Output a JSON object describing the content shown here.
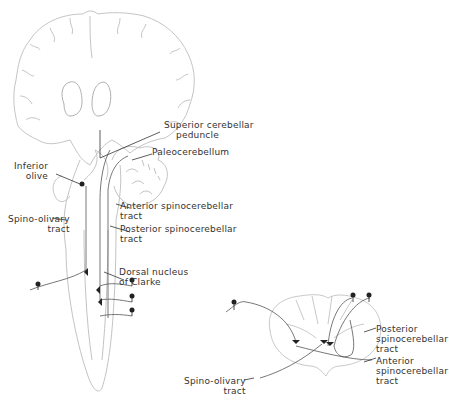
{
  "figure": {
    "left_panel": "Brain coronal section with brainstem and spinal cord (spinocerebellar pathways)",
    "right_panel": "Spinal cord cross-section"
  },
  "labels": {
    "superior_cerebellar_peduncle": [
      "Superior cerebellar",
      "peduncle"
    ],
    "paleocerebellum": [
      "Paleocerebellum"
    ],
    "inferior_olive": [
      "Inferior",
      "olive"
    ],
    "spino_olivary_tract_left": [
      "Spino-olivary",
      "tract"
    ],
    "anterior_spinocerebellar_tract_left": [
      "Anterior spinocerebellar",
      "tract"
    ],
    "posterior_spinocerebellar_tract_left": [
      "Posterior spinocerebellar",
      "tract"
    ],
    "dorsal_nucleus_of_clarke": [
      "Dorsal nucleus",
      "of Clarke"
    ],
    "posterior_spinocerebellar_tract_right": [
      "Posterior",
      "spinocerebellar",
      "tract"
    ],
    "anterior_spinocerebellar_tract_right": [
      "Anterior",
      "spinocerebellar",
      "tract"
    ],
    "spino_olivary_tract_right": [
      "Spino-olivary",
      "tract"
    ]
  },
  "colors": {
    "outline": "#b8b8b8",
    "pathway": "#555555",
    "text": "#333333"
  }
}
